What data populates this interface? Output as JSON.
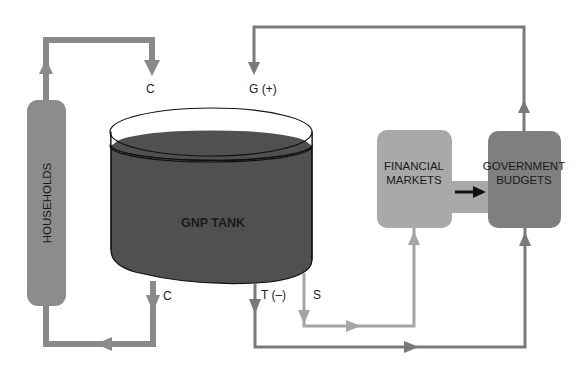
{
  "diagram": {
    "nodes": {
      "households": {
        "label": "HOUSEHOLDS",
        "color": "#8c8c8c"
      },
      "gnp_tank": {
        "label": "GNP TANK",
        "color": "#505050"
      },
      "financial_markets": {
        "label_line1": "FINANCIAL",
        "label_line2": "MARKETS",
        "color": "#a9a9a9"
      },
      "government_budgets": {
        "label_line1": "GOVERNMENT",
        "label_line2": "BUDGETS",
        "color": "#7f7f7f"
      }
    },
    "flows": {
      "c_in": {
        "label": "C",
        "from": "HOUSEHOLDS",
        "to": "GNP TANK"
      },
      "g_in": {
        "label": "G (+)",
        "from": "GOVERNMENT BUDGETS",
        "to": "GNP TANK"
      },
      "c_out": {
        "label": "C",
        "from": "GNP TANK",
        "to": "HOUSEHOLDS"
      },
      "t_out": {
        "label": "T (–)",
        "from": "GNP TANK",
        "to": "GOVERNMENT BUDGETS"
      },
      "s_out": {
        "label": "S",
        "from": "GNP TANK",
        "to": "FINANCIAL MARKETS"
      },
      "fm_to_gov": {
        "label": "",
        "from": "FINANCIAL MARKETS",
        "to": "GOVERNMENT BUDGETS"
      }
    },
    "colors": {
      "thick_arrow": "#8a8a8a",
      "thin_arrow_dark": "#7a7a7a",
      "thin_arrow_light": "#a5a5a5",
      "black_arrow": "#111111"
    }
  }
}
